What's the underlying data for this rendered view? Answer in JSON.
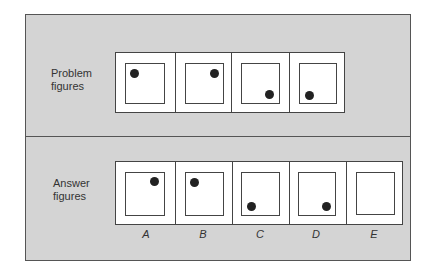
{
  "problem": {
    "label_line1": "Problem",
    "label_line2": "figures",
    "figures": [
      {
        "dot": "top-left"
      },
      {
        "dot": "top-right"
      },
      {
        "dot": "bottom-right"
      },
      {
        "dot": "bottom-left"
      }
    ]
  },
  "answers": {
    "label_line1": "Answer",
    "label_line2": "figures",
    "options": [
      {
        "letter": "A",
        "dot": "top-right"
      },
      {
        "letter": "B",
        "dot": "top-left"
      },
      {
        "letter": "C",
        "dot": "bottom-left"
      },
      {
        "letter": "D",
        "dot": "bottom-right"
      },
      {
        "letter": "E",
        "dot": "none"
      }
    ]
  },
  "colors": {
    "panel_bg": "#d4d4d4",
    "border": "#444444",
    "dot": "#222222"
  }
}
